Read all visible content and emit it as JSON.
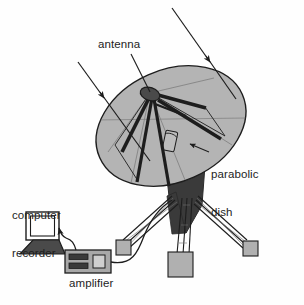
{
  "figure": {
    "background_color": "#fefefe",
    "line_color": "#1d1d1d",
    "dish_fill": "#b4b4b4",
    "dish_shadow_fill": "#8e8e8e",
    "mount_fill": "#3a3a3a",
    "pad_fill": "#b0b0b0",
    "device_fill": "#a8a8a8",
    "screen_fill": "#ffffff",
    "text_color": "#1d1d1d"
  },
  "labels": {
    "antenna": "antenna",
    "parabolic_dish_line1": "parabolic",
    "parabolic_dish_line2": "dish",
    "computer_line1": "computer",
    "computer_line2": "recorder",
    "amplifier": "amplifier"
  },
  "parts": {
    "incoming_rays": 2,
    "feed_struts": 5,
    "tripod_legs": 3,
    "foot_pads": 3,
    "amplifier_slots": 2,
    "amplifier_knobs": 1
  }
}
